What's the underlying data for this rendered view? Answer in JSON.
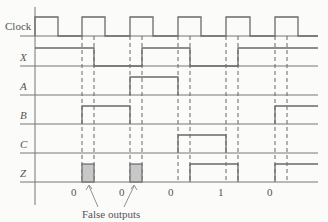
{
  "diagram": {
    "type": "timing-diagram",
    "signals": [
      {
        "name": "Clock",
        "italic": false,
        "levels": [
          [
            0,
            1
          ],
          [
            1,
            0
          ],
          [
            2,
            1
          ],
          [
            3,
            0
          ],
          [
            4,
            1
          ],
          [
            5,
            0
          ],
          [
            6,
            1
          ],
          [
            7,
            0
          ],
          [
            8,
            1
          ],
          [
            9,
            0
          ],
          [
            10,
            1
          ],
          [
            11,
            0
          ]
        ]
      },
      {
        "name": "X",
        "italic": true
      },
      {
        "name": "A",
        "italic": true
      },
      {
        "name": "B",
        "italic": true
      },
      {
        "name": "C",
        "italic": true
      },
      {
        "name": "Z",
        "italic": true
      }
    ],
    "outputs": [
      "0",
      "0",
      "0",
      "1",
      "0"
    ],
    "annotation": "False outputs",
    "accent_colors": {
      "line": "#6a6a6a",
      "shade": "#c8c8c8",
      "background": "#fbfbf9"
    }
  }
}
